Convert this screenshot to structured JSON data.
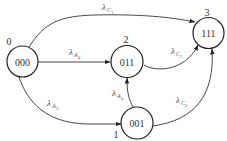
{
  "diagram": {
    "type": "state-transition",
    "nodes": [
      {
        "id": "0",
        "index_label": "0",
        "state": "000"
      },
      {
        "id": "1",
        "index_label": "1",
        "state": "001"
      },
      {
        "id": "2",
        "index_label": "2",
        "state": "011"
      },
      {
        "id": "3",
        "index_label": "3",
        "state": "111"
      }
    ],
    "edges": [
      {
        "from": "0",
        "to": "3",
        "symbol": "λ",
        "sub": "C",
        "subsub": "1"
      },
      {
        "from": "0",
        "to": "2",
        "symbol": "λ",
        "sub": "A",
        "subsub": "4"
      },
      {
        "from": "2",
        "to": "3",
        "symbol": "λ",
        "sub": "C",
        "subsub": "2"
      },
      {
        "from": "1",
        "to": "2",
        "symbol": "λ",
        "sub": "A",
        "subsub": "4"
      },
      {
        "from": "0",
        "to": "1",
        "symbol": "λ",
        "sub": "A",
        "subsub": "3"
      },
      {
        "from": "1",
        "to": "3",
        "symbol": "λ",
        "sub": "C",
        "subsub": "3"
      }
    ],
    "colors": {
      "stroke": "#222222",
      "text": "#333333",
      "background": "#ffffff"
    }
  }
}
